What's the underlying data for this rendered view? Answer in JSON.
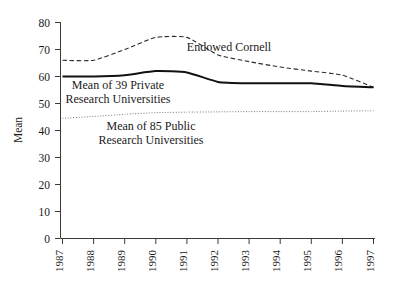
{
  "chart_data": {
    "type": "line",
    "title": "",
    "xlabel": "",
    "ylabel": "Mean",
    "ylim": [
      0,
      80
    ],
    "ytick_step": 10,
    "grid": false,
    "legend_position": "inline-annotations",
    "categories": [
      "1987",
      "1988",
      "1989",
      "1990",
      "1991",
      "1992",
      "1993",
      "1994",
      "1995",
      "1996",
      "1997"
    ],
    "yticks": [
      "0",
      "10",
      "20",
      "30",
      "40",
      "50",
      "60",
      "70",
      "80"
    ],
    "series": [
      {
        "name": "Endowed Cornell",
        "style": "dashed",
        "color": "#2b2b2b",
        "values": [
          66,
          66,
          70,
          74.5,
          74.5,
          68,
          65.5,
          63.5,
          62,
          60.5,
          56
        ]
      },
      {
        "name": "Mean of 39 Private Research Universities",
        "style": "solid",
        "color": "#111111",
        "values": [
          60,
          60,
          60.5,
          62,
          61.5,
          58,
          57.5,
          57.5,
          57.5,
          56.5,
          56
        ]
      },
      {
        "name": "Mean of 85 Public Research Universities",
        "style": "dotted",
        "color": "#7a7a7a",
        "values": [
          44.5,
          45.2,
          46,
          46.6,
          46.8,
          46.9,
          47,
          47,
          47,
          47.2,
          47.3
        ]
      }
    ],
    "annotations": [
      {
        "id": "endowed-cornell",
        "text": "Endowed Cornell",
        "lines": [
          "Endowed Cornell"
        ],
        "x": 229,
        "y": 51
      },
      {
        "id": "private-universities",
        "text": "Mean of 39 Private Research Universities",
        "lines": [
          "Mean of 39 Private",
          "Research Universities"
        ],
        "x": 118,
        "y": 89
      },
      {
        "id": "public-universities",
        "text": "Mean of 85 Public Research Universities",
        "lines": [
          "Mean of 85 Public",
          "Research Universities"
        ],
        "x": 151,
        "y": 130
      }
    ]
  },
  "axes": {
    "y_title": "Mean",
    "y_labels": [
      "80",
      "70",
      "60",
      "50",
      "40",
      "30",
      "20",
      "10",
      "0"
    ],
    "x_labels": [
      "1987",
      "1988",
      "1989",
      "1990",
      "1991",
      "1992",
      "1993",
      "1994",
      "1995",
      "1996",
      "1997"
    ]
  }
}
